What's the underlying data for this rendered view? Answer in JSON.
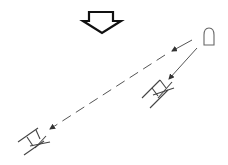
{
  "diagram": {
    "colors": {
      "stroke": "#222222",
      "arrow_outline": "#111111",
      "line": "#555555",
      "background": "#ffffff"
    },
    "elements": [
      {
        "id": "direction-arrow",
        "shape": "hollow-down-arrow"
      },
      {
        "id": "source",
        "shape": "rounded-capsule"
      },
      {
        "id": "target-near",
        "shape": "ladder-x-glyph"
      },
      {
        "id": "target-far",
        "shape": "ladder-x-glyph"
      }
    ],
    "connections": [
      {
        "from": "source",
        "to": "target-far",
        "style": "dashed",
        "arrow": "end"
      },
      {
        "from": "source",
        "to": "target-near",
        "style": "solid",
        "arrow": "end"
      }
    ]
  }
}
